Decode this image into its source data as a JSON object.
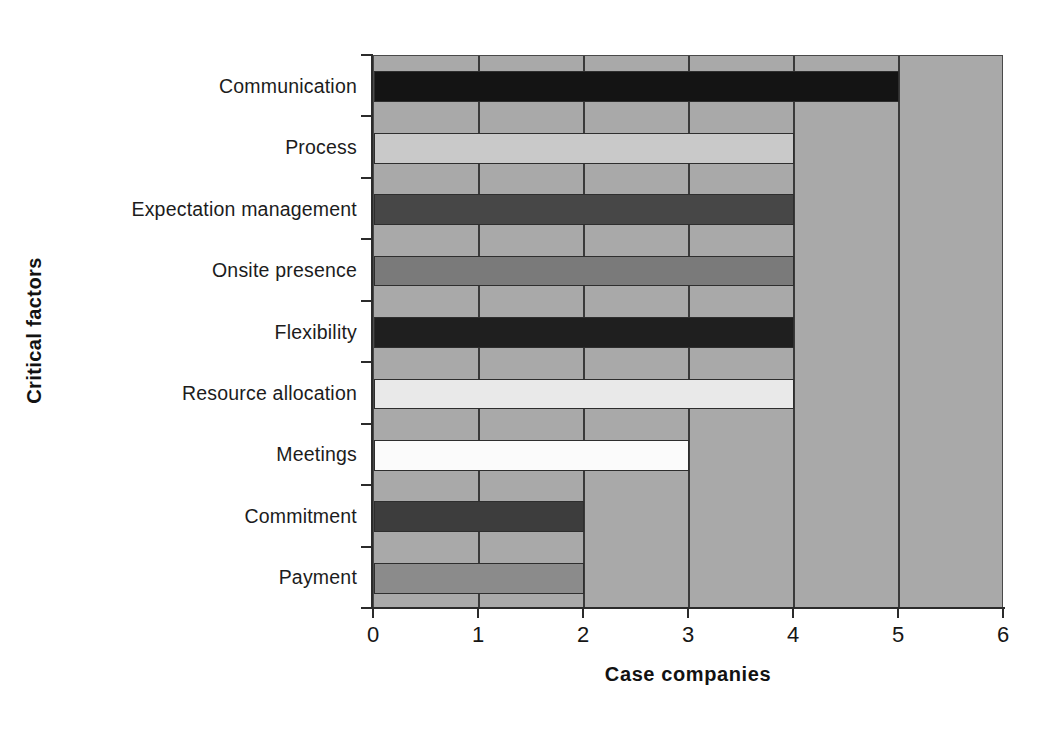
{
  "chart_data": {
    "type": "bar",
    "orientation": "horizontal",
    "title": "",
    "xlabel": "Case companies",
    "ylabel": "Critical factors",
    "xlim": [
      0,
      6
    ],
    "xticks": [
      "0",
      "1",
      "2",
      "3",
      "4",
      "5",
      "6"
    ],
    "grid": "vertical",
    "legend": "none",
    "plot_background": "#a9a9a9",
    "categories": [
      "Communication",
      "Process",
      "Expectation management",
      "Onsite presence",
      "Flexibility",
      "Resource allocation",
      "Meetings",
      "Commitment",
      "Payment"
    ],
    "values": [
      5,
      4,
      4,
      4,
      4,
      4,
      3,
      2,
      2
    ],
    "bar_colors": [
      "#141414",
      "#c9c9c9",
      "#474747",
      "#7a7a7a",
      "#1f1f1f",
      "#e9e9e9",
      "#fbfbfb",
      "#3d3d3d",
      "#8b8b8b"
    ]
  },
  "axes": {
    "x_title": "Case companies",
    "y_title": "Critical factors"
  }
}
